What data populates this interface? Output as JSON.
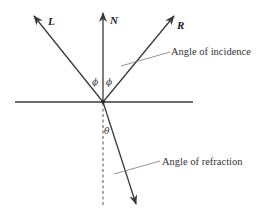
{
  "diagram": {
    "colors": {
      "line": "#3a3a3a",
      "leader": "#777777",
      "text": "#333333",
      "background": "#ffffff"
    },
    "labels": {
      "L": "L",
      "N": "N",
      "R": "R",
      "phi_left": "ϕ",
      "phi_right": "ϕ",
      "theta": "θ"
    },
    "annotations": {
      "incidence": "Angle of incidence",
      "refraction": "Angle of refraction"
    },
    "vectors": [
      {
        "name": "L",
        "description": "light direction vector"
      },
      {
        "name": "N",
        "description": "surface normal"
      },
      {
        "name": "R",
        "description": "reflected vector"
      },
      {
        "name": "T",
        "description": "refracted vector (unlabeled)"
      }
    ]
  }
}
